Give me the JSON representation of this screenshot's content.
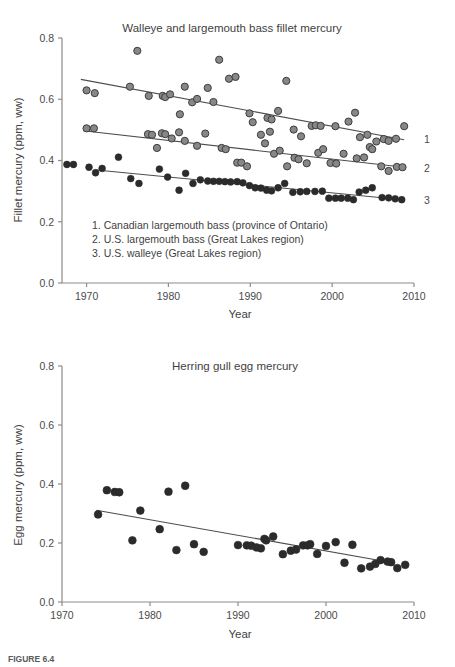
{
  "figure": {
    "caption_prefix": "FIGURE 6.4",
    "caption_text": "",
    "marker_colors": {
      "open_gray": "#878787",
      "open_gray_edge": "#3d3d3d",
      "solid_dark": "#2b2b2b",
      "trend": "#4d4d4d",
      "axis": "#8c8c8c",
      "text": "#3f3f3f"
    }
  },
  "chart_data": [
    {
      "type": "scatter",
      "id": "fillet-mercury",
      "title": "Walleye and largemouth bass fillet mercury",
      "xlabel": "Year",
      "ylabel": "Fillet mercury (ppm, ww)",
      "xlim": [
        1967,
        2010
      ],
      "ylim": [
        0.0,
        0.8
      ],
      "xticks": [
        1970,
        1980,
        1990,
        2000,
        2010
      ],
      "yticks": [
        0.0,
        0.2,
        0.4,
        0.6,
        0.8
      ],
      "ytick_labels": [
        "0.0",
        "0.2",
        "0.4",
        "0.6",
        "0.8"
      ],
      "xtick_labels": [
        "1970",
        "1980",
        "1990",
        "2000",
        "2010"
      ],
      "grid": false,
      "legend_position": "inside-lower-left",
      "legend_entries": [
        "1. Canadian largemouth bass (province of Ontario)",
        "2. U.S. largemouth bass (Great Lakes region)",
        "3. U.S. walleye (Great Lakes region)"
      ],
      "right_labels": [
        {
          "text": "1",
          "y": 0.47
        },
        {
          "text": "2",
          "y": 0.375
        },
        {
          "text": "3",
          "y": 0.272
        }
      ],
      "series": [
        {
          "name": "1. Canadian largemouth bass (province of Ontario)",
          "marker": "open-gray",
          "trend": {
            "x0": 1969.3,
            "y0": 0.665,
            "x1": 2008.8,
            "y1": 0.468
          },
          "points": [
            [
              1970.0,
              0.629
            ],
            [
              1971.0,
              0.62
            ],
            [
              1975.3,
              0.641
            ],
            [
              1976.2,
              0.758
            ],
            [
              1977.6,
              0.611
            ],
            [
              1979.3,
              0.611
            ],
            [
              1979.6,
              0.607
            ],
            [
              1980.2,
              0.616
            ],
            [
              1981.4,
              0.551
            ],
            [
              1982.0,
              0.641
            ],
            [
              1982.9,
              0.59
            ],
            [
              1983.5,
              0.601
            ],
            [
              1984.8,
              0.637
            ],
            [
              1985.5,
              0.591
            ],
            [
              1986.2,
              0.729
            ],
            [
              1987.4,
              0.667
            ],
            [
              1988.2,
              0.673
            ],
            [
              1989.9,
              0.554
            ],
            [
              1990.3,
              0.525
            ],
            [
              1992.1,
              0.539
            ],
            [
              1992.6,
              0.534
            ],
            [
              1993.4,
              0.562
            ],
            [
              1994.4,
              0.66
            ],
            [
              1995.3,
              0.501
            ],
            [
              1996.2,
              0.479
            ],
            [
              1997.5,
              0.513
            ],
            [
              1998.0,
              0.515
            ],
            [
              1998.6,
              0.513
            ],
            [
              2000.4,
              0.512
            ],
            [
              2002.0,
              0.527
            ],
            [
              2002.8,
              0.556
            ],
            [
              2003.4,
              0.476
            ],
            [
              2004.3,
              0.484
            ],
            [
              2005.4,
              0.462
            ],
            [
              2006.3,
              0.47
            ],
            [
              2006.9,
              0.464
            ],
            [
              2007.8,
              0.471
            ],
            [
              2008.8,
              0.512
            ]
          ]
        },
        {
          "name": "2. U.S. largemouth bass (Great Lakes region)",
          "marker": "open-gray",
          "trend": {
            "x0": 1969.6,
            "y0": 0.497,
            "x1": 2008.8,
            "y1": 0.378
          },
          "points": [
            [
              1970.0,
              0.505
            ],
            [
              1970.9,
              0.505
            ],
            [
              1977.5,
              0.486
            ],
            [
              1978.0,
              0.484
            ],
            [
              1978.6,
              0.441
            ],
            [
              1979.2,
              0.489
            ],
            [
              1979.6,
              0.486
            ],
            [
              1980.4,
              0.472
            ],
            [
              1981.3,
              0.492
            ],
            [
              1982.0,
              0.464
            ],
            [
              1983.5,
              0.448
            ],
            [
              1984.5,
              0.488
            ],
            [
              1986.5,
              0.441
            ],
            [
              1987.0,
              0.437
            ],
            [
              1988.4,
              0.393
            ],
            [
              1988.9,
              0.393
            ],
            [
              1989.6,
              0.381
            ],
            [
              1991.3,
              0.484
            ],
            [
              1991.8,
              0.456
            ],
            [
              1992.4,
              0.494
            ],
            [
              1992.9,
              0.422
            ],
            [
              1993.6,
              0.432
            ],
            [
              1994.5,
              0.381
            ],
            [
              1995.4,
              0.409
            ],
            [
              1995.9,
              0.404
            ],
            [
              1996.9,
              0.391
            ],
            [
              1998.3,
              0.425
            ],
            [
              1998.9,
              0.437
            ],
            [
              1999.8,
              0.392
            ],
            [
              2000.5,
              0.39
            ],
            [
              2001.4,
              0.422
            ],
            [
              2003.0,
              0.407
            ],
            [
              2003.9,
              0.41
            ],
            [
              2004.6,
              0.444
            ],
            [
              2004.9,
              0.437
            ],
            [
              2006.0,
              0.381
            ],
            [
              2006.9,
              0.366
            ],
            [
              2007.9,
              0.379
            ],
            [
              2008.6,
              0.378
            ]
          ]
        },
        {
          "name": "3. U.S. walleye (Great Lakes region)",
          "marker": "solid-dark",
          "trend": {
            "x0": 1971.2,
            "y0": 0.369,
            "x1": 2008.6,
            "y1": 0.272
          },
          "points": [
            [
              1967.6,
              0.387
            ],
            [
              1968.4,
              0.387
            ],
            [
              1970.3,
              0.378
            ],
            [
              1971.1,
              0.36
            ],
            [
              1971.9,
              0.374
            ],
            [
              1973.9,
              0.411
            ],
            [
              1975.4,
              0.341
            ],
            [
              1976.4,
              0.325
            ],
            [
              1978.9,
              0.372
            ],
            [
              1979.9,
              0.346
            ],
            [
              1981.3,
              0.303
            ],
            [
              1982.1,
              0.358
            ],
            [
              1983.0,
              0.325
            ],
            [
              1983.9,
              0.337
            ],
            [
              1984.8,
              0.333
            ],
            [
              1985.5,
              0.332
            ],
            [
              1986.2,
              0.332
            ],
            [
              1986.9,
              0.331
            ],
            [
              1987.6,
              0.33
            ],
            [
              1988.4,
              0.331
            ],
            [
              1989.1,
              0.327
            ],
            [
              1989.9,
              0.318
            ],
            [
              1990.6,
              0.311
            ],
            [
              1991.3,
              0.31
            ],
            [
              1992.0,
              0.303
            ],
            [
              1992.6,
              0.301
            ],
            [
              1993.4,
              0.311
            ],
            [
              1994.2,
              0.325
            ],
            [
              1995.2,
              0.296
            ],
            [
              1996.1,
              0.298
            ],
            [
              1996.9,
              0.299
            ],
            [
              1997.9,
              0.299
            ],
            [
              1998.8,
              0.3
            ],
            [
              1999.6,
              0.277
            ],
            [
              2000.4,
              0.277
            ],
            [
              2001.1,
              0.277
            ],
            [
              2001.9,
              0.277
            ],
            [
              2002.6,
              0.272
            ],
            [
              2003.3,
              0.297
            ],
            [
              2004.1,
              0.303
            ],
            [
              2004.9,
              0.311
            ],
            [
              2006.1,
              0.279
            ],
            [
              2006.9,
              0.278
            ],
            [
              2007.7,
              0.275
            ],
            [
              2008.5,
              0.272
            ]
          ]
        }
      ]
    },
    {
      "type": "scatter",
      "id": "egg-mercury",
      "title": "Herring gull egg mercury",
      "xlabel": "Year",
      "ylabel": "Egg mercury (ppm, ww)",
      "xlim": [
        1970,
        2010
      ],
      "ylim": [
        0.0,
        0.8
      ],
      "xticks": [
        1970,
        1980,
        1990,
        2000,
        2010
      ],
      "yticks": [
        0.0,
        0.2,
        0.4,
        0.6,
        0.8
      ],
      "ytick_labels": [
        "0.0",
        "0.2",
        "0.4",
        "0.6",
        "0.8"
      ],
      "xtick_labels": [
        "1970",
        "1980",
        "1990",
        "2000",
        "2010"
      ],
      "grid": false,
      "series": [
        {
          "name": "Herring gull egg mercury",
          "marker": "solid-dark",
          "trend": {
            "x0": 1973.9,
            "y0": 0.311,
            "x1": 2007.4,
            "y1": 0.134
          },
          "points": [
            [
              1974.1,
              0.297
            ],
            [
              1975.1,
              0.379
            ],
            [
              1976.0,
              0.373
            ],
            [
              1976.5,
              0.372
            ],
            [
              1978.0,
              0.209
            ],
            [
              1978.9,
              0.31
            ],
            [
              1981.1,
              0.247
            ],
            [
              1982.1,
              0.374
            ],
            [
              1983.0,
              0.176
            ],
            [
              1984.0,
              0.394
            ],
            [
              1985.0,
              0.196
            ],
            [
              1986.1,
              0.17
            ],
            [
              1990.0,
              0.193
            ],
            [
              1991.0,
              0.192
            ],
            [
              1991.5,
              0.191
            ],
            [
              1992.1,
              0.185
            ],
            [
              1992.6,
              0.182
            ],
            [
              1993.0,
              0.214
            ],
            [
              1993.2,
              0.209
            ],
            [
              1994.0,
              0.222
            ],
            [
              1995.1,
              0.162
            ],
            [
              1996.0,
              0.174
            ],
            [
              1996.6,
              0.178
            ],
            [
              1997.4,
              0.192
            ],
            [
              1997.9,
              0.192
            ],
            [
              1998.2,
              0.196
            ],
            [
              1999.0,
              0.163
            ],
            [
              2000.0,
              0.19
            ],
            [
              2001.1,
              0.203
            ],
            [
              2002.1,
              0.133
            ],
            [
              2003.0,
              0.194
            ],
            [
              2004.0,
              0.114
            ],
            [
              2005.0,
              0.12
            ],
            [
              2005.6,
              0.129
            ],
            [
              2006.2,
              0.142
            ],
            [
              2007.0,
              0.137
            ],
            [
              2007.4,
              0.135
            ],
            [
              2008.1,
              0.115
            ],
            [
              2009.0,
              0.126
            ]
          ]
        }
      ]
    }
  ]
}
